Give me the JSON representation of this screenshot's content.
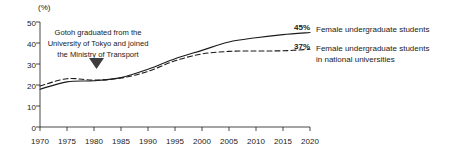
{
  "chart_data": {
    "type": "line",
    "title": "",
    "xlabel": "",
    "ylabel": "(%)",
    "yunit": "(%)",
    "xlim": [
      1970,
      2020
    ],
    "ylim": [
      0,
      50
    ],
    "ytick_step": 10,
    "xtick_step": 5,
    "grid": false,
    "legend_position": "right-of-plot",
    "x": [
      1970,
      1975,
      1980,
      1985,
      1990,
      1995,
      2000,
      2005,
      2010,
      2015,
      2020
    ],
    "xticks": [
      "1970",
      "1975",
      "1980",
      "1985",
      "1990",
      "1995",
      "2000",
      "2005",
      "2010",
      "2015",
      "2020"
    ],
    "yticks": [
      "0",
      "10",
      "20",
      "30",
      "40",
      "50"
    ],
    "series": [
      {
        "name": "Female undergraduate students",
        "style": "solid",
        "end_label": "45%",
        "end_value": 45,
        "values": [
          18.0,
          21.5,
          22.0,
          23.5,
          27.5,
          32.5,
          36.5,
          40.5,
          42.5,
          44.0,
          45.0
        ]
      },
      {
        "name": "Female undergraduate students in national universities",
        "style": "dashed",
        "end_label": "37%",
        "end_value": 37,
        "values": [
          19.5,
          23.0,
          22.3,
          23.3,
          26.5,
          31.5,
          34.8,
          36.0,
          36.2,
          36.3,
          37.0
        ]
      }
    ],
    "annotations": [
      {
        "text": "Gotoh graduated from the University of Tokyo and joined the Ministry of Transport",
        "line1": "Gotoh graduated from the",
        "line2": "University of Tokyo and joined",
        "line3": "the Ministry of Transport",
        "marker": "down-triangle",
        "points_to_year": 1980
      }
    ],
    "colors": {
      "line": "#1a1a1a",
      "axis": "#1a1a1a",
      "background": "#ffffff",
      "text": "#1a1a1a"
    }
  },
  "legend": {
    "entries": [
      {
        "value": "45%",
        "label_line1": "Female undergraduate students",
        "label_line2": ""
      },
      {
        "value": "37%",
        "label_line1": "Female undergraduate students",
        "label_line2": "in national universities"
      }
    ]
  }
}
